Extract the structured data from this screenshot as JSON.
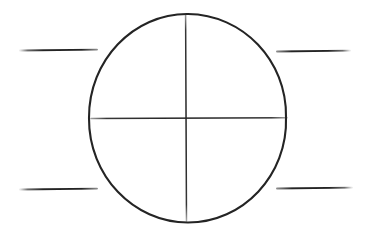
{
  "figure": {
    "canvas": {
      "width": 368,
      "height": 241,
      "background_color": "#ffffff"
    },
    "ink_color": "#242424",
    "ink_color_light": "#3a3a3a"
  },
  "shapes": {
    "circle": {
      "name": "reticle-circle",
      "center_x": 188,
      "center_y": 118,
      "radius_x": 99,
      "radius_y": 104,
      "stroke_width": 2.1,
      "color": "#242424"
    },
    "crosshair_vertical": {
      "name": "crosshair-vertical-line",
      "x": 186,
      "y_start": 14,
      "y_end": 221,
      "stroke_width": 1.5,
      "color": "#2b2b2b"
    },
    "crosshair_horizontal": {
      "name": "crosshair-horizontal-line",
      "y": 118,
      "x_start": 91,
      "x_end": 287,
      "stroke_width": 1.5,
      "color": "#2b2b2b"
    },
    "stadia_lines": [
      {
        "name": "stadia-line-top-left",
        "position": "top-left",
        "x_start": 20,
        "x_end": 97,
        "y": 50,
        "stroke_width": 1.9,
        "color": "#2e2e2e"
      },
      {
        "name": "stadia-line-top-right",
        "position": "top-right",
        "x_start": 277,
        "x_end": 350,
        "y": 51,
        "stroke_width": 1.9,
        "color": "#2e2e2e"
      },
      {
        "name": "stadia-line-bottom-left",
        "position": "bottom-left",
        "x_start": 20,
        "x_end": 97,
        "y": 189,
        "stroke_width": 1.9,
        "color": "#2e2e2e"
      },
      {
        "name": "stadia-line-bottom-right",
        "position": "bottom-right",
        "x_start": 277,
        "x_end": 352,
        "y": 188,
        "stroke_width": 1.9,
        "color": "#2e2e2e"
      }
    ]
  }
}
